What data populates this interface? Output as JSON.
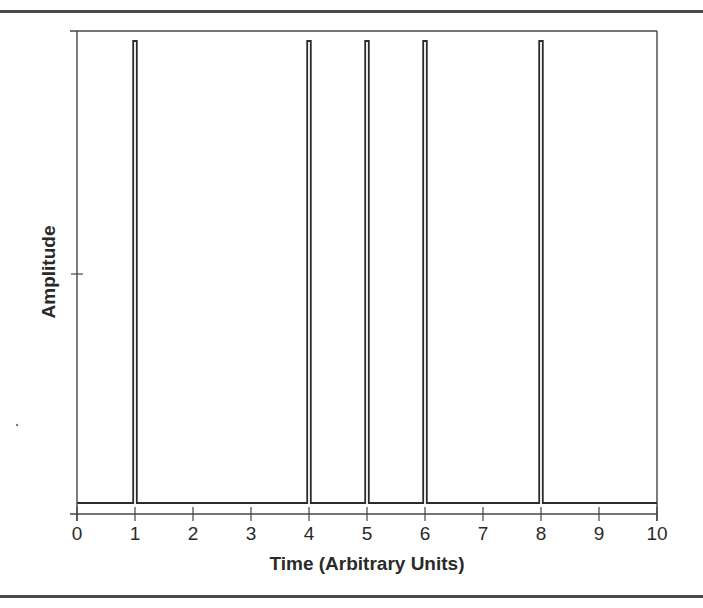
{
  "chart_data": {
    "type": "line",
    "title": "",
    "xlabel": "Time (Arbitrary Units)",
    "ylabel": "Amplitude",
    "xlim": [
      0,
      10
    ],
    "ylim": [
      0,
      1
    ],
    "x_ticks": [
      "0",
      "1",
      "2",
      "3",
      "4",
      "5",
      "6",
      "7",
      "8",
      "9",
      "10"
    ],
    "y_ticks": [
      0.5
    ],
    "y_tick_labels": [],
    "grid": false,
    "legend": null,
    "series": [
      {
        "name": "signal",
        "baseline": 0.02,
        "spikes": [
          {
            "x": 1,
            "y": 1.0
          },
          {
            "x": 4,
            "y": 1.0
          },
          {
            "x": 5,
            "y": 1.0
          },
          {
            "x": 6,
            "y": 1.0
          },
          {
            "x": 8,
            "y": 1.0
          }
        ]
      }
    ]
  },
  "colors": {
    "line": "#2b2b2b",
    "axis": "#444444",
    "frame": "#4a4a4a",
    "background": "#ffffff"
  }
}
